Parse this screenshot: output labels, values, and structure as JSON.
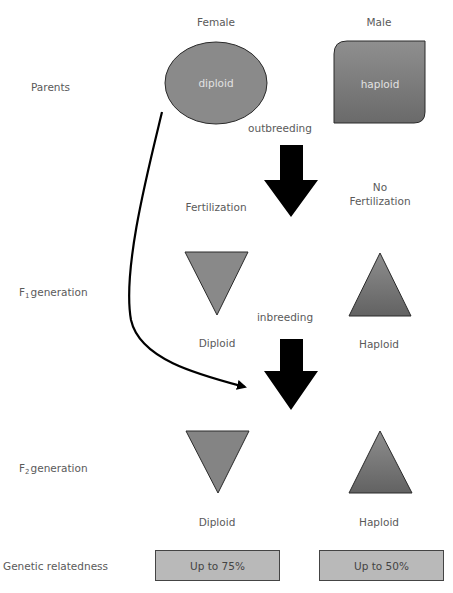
{
  "columns": {
    "female": "Female",
    "male": "Male"
  },
  "rows": {
    "parents": "Parents",
    "f1_prefix": "F",
    "f1_sub": "1",
    "f1_suffix": "generation",
    "f2_prefix": "F",
    "f2_sub": "2",
    "f2_suffix": "generation",
    "relatedness": "Genetic relatedness"
  },
  "parents": {
    "female_shape_label": "diploid",
    "male_shape_label": "haploid"
  },
  "transitions": {
    "outbreeding": "outbreeding",
    "fertilization": "Fertilization",
    "no_fertilization_line1": "No",
    "no_fertilization_line2": "Fertilization",
    "inbreeding": "inbreeding"
  },
  "f1": {
    "female_label": "Diploid",
    "male_label": "Haploid"
  },
  "f2": {
    "female_label": "Diploid",
    "male_label": "Haploid"
  },
  "relatedness": {
    "female_value": "Up to 75%",
    "male_value": "Up to 50%"
  },
  "colors": {
    "shape_fill": "#8a8a8a",
    "shape_dark": "#666666",
    "box_fill": "#b9b9b9",
    "arrow": "#000000"
  }
}
